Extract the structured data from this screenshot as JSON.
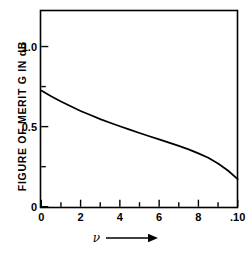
{
  "chart_data": {
    "type": "line",
    "title": "",
    "subtitle": "",
    "xlabel": "ν",
    "ylabel": "FIGURE OF MERIT G IN dB",
    "xlabel_arrow": "⟶",
    "xlim": [
      0,
      0.1
    ],
    "ylim": [
      0,
      1.22
    ],
    "grid": false,
    "legend": null,
    "xticks": [
      {
        "value": 0,
        "label": "0",
        "major": true
      },
      {
        "value": 0.01,
        "label": "",
        "major": false
      },
      {
        "value": 0.02,
        "label": "2",
        "major": true
      },
      {
        "value": 0.03,
        "label": "",
        "major": false
      },
      {
        "value": 0.04,
        "label": "4",
        "major": true
      },
      {
        "value": 0.05,
        "label": "",
        "major": false
      },
      {
        "value": 0.06,
        "label": "6",
        "major": true
      },
      {
        "value": 0.07,
        "label": "",
        "major": false
      },
      {
        "value": 0.08,
        "label": "8",
        "major": true
      },
      {
        "value": 0.09,
        "label": "",
        "major": false
      },
      {
        "value": 0.1,
        "label": ".10",
        "major": true
      }
    ],
    "yticks": [
      {
        "value": 0,
        "label": "0",
        "major": true
      },
      {
        "value": 0.25,
        "label": "",
        "major": false
      },
      {
        "value": 0.5,
        "label": "0.5",
        "major": true
      },
      {
        "value": 0.75,
        "label": "",
        "major": false
      },
      {
        "value": 1.0,
        "label": "1.0",
        "major": true
      }
    ],
    "series": [
      {
        "name": "G",
        "color": "#000000",
        "x": [
          0.0,
          0.005,
          0.01,
          0.015,
          0.02,
          0.025,
          0.03,
          0.035,
          0.04,
          0.045,
          0.05,
          0.055,
          0.06,
          0.065,
          0.07,
          0.075,
          0.08,
          0.085,
          0.09,
          0.095,
          0.1
        ],
        "y": [
          0.725,
          0.69,
          0.657,
          0.627,
          0.598,
          0.572,
          0.547,
          0.524,
          0.502,
          0.481,
          0.46,
          0.44,
          0.42,
          0.4,
          0.38,
          0.358,
          0.333,
          0.305,
          0.27,
          0.226,
          0.172
        ]
      }
    ],
    "axis_style": {
      "frame": "box",
      "line_color": "#000000",
      "line_width_px": 1.6,
      "tick_direction": "in"
    }
  },
  "figure": {
    "background": "#ffffff",
    "foreground": "#000000"
  }
}
